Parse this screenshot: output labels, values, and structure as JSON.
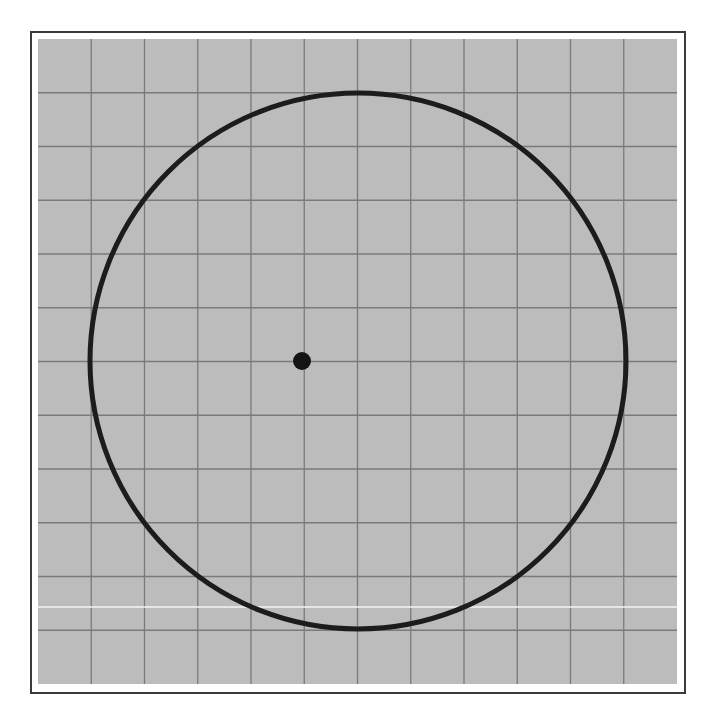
{
  "figure": {
    "grid": {
      "columns": 12,
      "rows": 12,
      "background_color": "#bcbcbc",
      "line_color": "#7a7a7a",
      "x0": 38,
      "y0": 39,
      "x1": 677,
      "y1": 684
    },
    "frame": {
      "border_color": "#3a3a3a"
    },
    "circle": {
      "cx": 358,
      "cy": 361,
      "r": 268,
      "stroke_color": "#1c1c1c",
      "stroke_width": 5,
      "grid_center": [
        6,
        6
      ],
      "grid_radius_cells": 5
    },
    "point": {
      "cx": 302,
      "cy": 361,
      "r": 9,
      "color": "#141414",
      "grid_position": [
        5,
        6
      ]
    },
    "artifact_line": {
      "y": 607,
      "color": "#f4f4f4"
    }
  }
}
